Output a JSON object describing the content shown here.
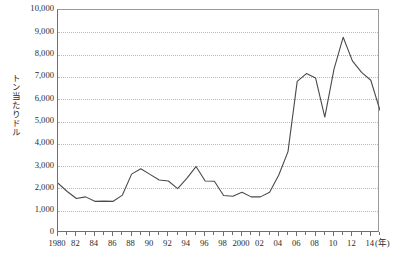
{
  "chart_data": {
    "type": "line",
    "title": "",
    "xlabel": "(年)",
    "ylabel": "トン当たりドル",
    "ylim": [
      0,
      10000
    ],
    "xlim": [
      1980,
      2015
    ],
    "grid": true,
    "legend": "none",
    "y_ticks": [
      "0",
      "1,000",
      "2,000",
      "3,000",
      "4,000",
      "5,000",
      "6,000",
      "7,000",
      "8,000",
      "9,000",
      "10,000"
    ],
    "y_tick_values": [
      0,
      1000,
      2000,
      3000,
      4000,
      5000,
      6000,
      7000,
      8000,
      9000,
      10000
    ],
    "x_tick_labels": [
      "1980",
      "82",
      "84",
      "86",
      "88",
      "90",
      "92",
      "94",
      "96",
      "98",
      "2000",
      "02",
      "04",
      "06",
      "08",
      "10",
      "12",
      "14"
    ],
    "x_tick_values": [
      1980,
      1982,
      1984,
      1986,
      1988,
      1990,
      1992,
      1994,
      1996,
      1998,
      2000,
      2002,
      2004,
      2006,
      2008,
      2010,
      2012,
      2014
    ],
    "x": [
      1980,
      1981,
      1982,
      1983,
      1984,
      1985,
      1986,
      1987,
      1988,
      1989,
      1990,
      1991,
      1992,
      1993,
      1994,
      1995,
      1996,
      1997,
      1998,
      1999,
      2000,
      2001,
      2002,
      2003,
      2004,
      2005,
      2006,
      2007,
      2008,
      2009,
      2010,
      2011,
      2012,
      2013,
      2014,
      2015
    ],
    "values": [
      2230,
      1860,
      1550,
      1620,
      1420,
      1430,
      1420,
      1700,
      2640,
      2880,
      2630,
      2380,
      2330,
      1990,
      2450,
      2980,
      2330,
      2320,
      1680,
      1650,
      1830,
      1620,
      1620,
      1830,
      2600,
      3650,
      6800,
      7150,
      6950,
      5200,
      7350,
      8780,
      7720,
      7200,
      6850,
      5500
    ],
    "series_color": "#4a4a4a",
    "axis_color": "#6f6f6f",
    "gridline_color": "#b9b9b9",
    "background": "#ffffff"
  }
}
